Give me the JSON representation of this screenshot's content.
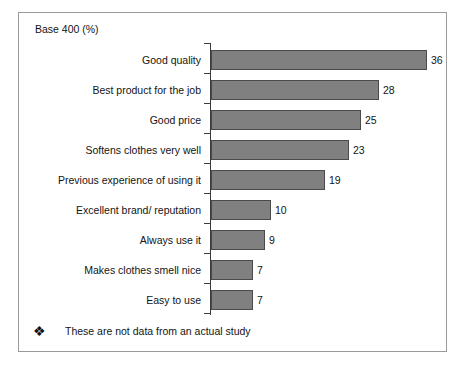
{
  "slide": {
    "base_label": "Base 400 (%)",
    "footnote": {
      "bullet_icon": "diamond-bullet-icon",
      "bullet_glyph": "❖",
      "text": "These are not data from an actual study"
    }
  },
  "chart_data": {
    "type": "bar",
    "orientation": "horizontal",
    "title": "Base 400 (%)",
    "xlabel": "",
    "ylabel": "",
    "xlim": [
      0,
      36
    ],
    "grid": false,
    "legend": null,
    "bar_color": "#808080",
    "bar_border_color": "#4a4a4a",
    "axis_color": "#3b3b3b",
    "show_value_labels": true,
    "categories": [
      "Good quality",
      "Best product for the job",
      "Good price",
      "Softens clothes very well",
      "Previous experience of using it",
      "Excellent brand/ reputation",
      "Always use it",
      "Makes clothes smell nice",
      "Easy to use"
    ],
    "values": [
      36,
      28,
      25,
      23,
      19,
      10,
      9,
      7,
      7
    ],
    "annotation": "These are not data from an actual study"
  }
}
